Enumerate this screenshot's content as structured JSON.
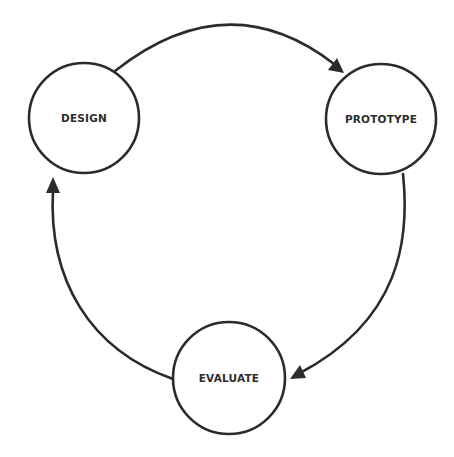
{
  "diagram": {
    "type": "cycle",
    "nodes": [
      {
        "id": "design",
        "label": "DESIGN"
      },
      {
        "id": "prototype",
        "label": "PROTOTYPE"
      },
      {
        "id": "evaluate",
        "label": "EVALUATE"
      }
    ],
    "edges": [
      {
        "from": "design",
        "to": "prototype"
      },
      {
        "from": "prototype",
        "to": "evaluate"
      },
      {
        "from": "evaluate",
        "to": "design"
      }
    ],
    "colors": {
      "stroke": "#2b2b2b",
      "text": "#2e2e2e",
      "background": "#ffffff"
    }
  }
}
